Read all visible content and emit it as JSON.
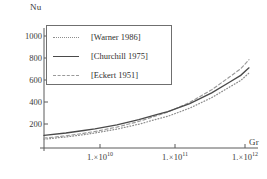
{
  "chart_data": {
    "type": "line",
    "title": "",
    "xlabel": "Gr",
    "ylabel": "Nu",
    "xscale": "log",
    "yscale": "linear",
    "xlim": [
      2000000000,
      1300000000000
    ],
    "ylim": [
      0,
      1120
    ],
    "grid": false,
    "legend_position": "upper-left",
    "xticks": [
      {
        "value": 10000000000,
        "label": "1. × 10",
        "exponent": "10"
      },
      {
        "value": 100000000000,
        "label": "1. × 10",
        "exponent": "11"
      },
      {
        "value": 1000000000000,
        "label": "1. × 10",
        "exponent": "12"
      }
    ],
    "yticks": [
      200,
      400,
      600,
      800,
      1000
    ],
    "x": [
      2000000000.0,
      4000000000.0,
      7000000000.0,
      10000000000.0,
      20000000000.0,
      40000000000.0,
      70000000000.0,
      100000000000.0,
      200000000000.0,
      400000000000.0,
      700000000000.0,
      1000000000000.0,
      1300000000000.0
    ],
    "series": [
      {
        "name": "[Warner 1986]",
        "style": "dotted",
        "color": "#8d8d8d",
        "values": [
          82,
          103,
          124,
          140,
          176,
          222,
          268,
          296,
          372,
          470,
          568,
          630,
          700
        ]
      },
      {
        "name": "[Churchill 1975]",
        "style": "solid",
        "color": "#4a4a4a",
        "values": [
          118,
          140,
          163,
          178,
          216,
          264,
          311,
          340,
          415,
          515,
          614,
          678,
          748
        ]
      },
      {
        "name": "[Eckert 1951]",
        "style": "dashed",
        "color": "#9a9a9a",
        "values": [
          92,
          114,
          137,
          154,
          195,
          248,
          301,
          335,
          426,
          543,
          662,
          740,
          824
        ]
      }
    ]
  },
  "axes": {
    "y_axis_label": "Nu",
    "x_axis_label": "Gr"
  },
  "legend": {
    "entries": [
      {
        "label": "[Warner 1986]",
        "style": "dotted"
      },
      {
        "label": "[Churchill 1975]",
        "style": "solid"
      },
      {
        "label": "[Eckert 1951]",
        "style": "dashed"
      }
    ]
  },
  "ticklabels": {
    "y": [
      "1000",
      "800",
      "600",
      "400",
      "200"
    ],
    "x_mantissa": [
      "1.",
      "1.",
      "1."
    ],
    "x_times": [
      "×",
      "×",
      "×"
    ],
    "x_base": [
      "10",
      "10",
      "10"
    ],
    "x_exp": [
      "10",
      "11",
      "12"
    ]
  }
}
